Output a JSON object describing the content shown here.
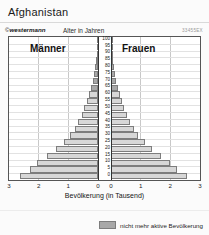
{
  "header": {
    "title": "Afghanistan",
    "brand": "westermann",
    "brand_mark": "©",
    "axis_title": "Alter in Jahren",
    "code": "33455EX"
  },
  "chart_data": {
    "type": "bar",
    "subtype": "population-pyramid",
    "title": "Afghanistan",
    "xlabel": "Bevölkerung (in Tausend)",
    "ylabel": "Alter in Jahren",
    "grid": true,
    "legend_position": "bottom-right",
    "panel_labels": {
      "left": "Männer",
      "right": "Frauen"
    },
    "xlim": [
      -3,
      3
    ],
    "xticks_left": [
      "3",
      "2",
      "1",
      "0"
    ],
    "xticks_right": [
      "0",
      "1",
      "2",
      "3"
    ],
    "unit": "Tausend",
    "age_groups": [
      "0",
      "5",
      "10",
      "15",
      "20",
      "25",
      "30",
      "35",
      "40",
      "45",
      "50",
      "55",
      "60",
      "65",
      "70",
      "75",
      "80",
      "85",
      "90",
      "95",
      "100"
    ],
    "series": [
      {
        "name": "Männer",
        "side": "left",
        "values": [
          2.62,
          2.3,
          2.05,
          1.72,
          1.42,
          1.16,
          0.94,
          0.78,
          0.66,
          0.55,
          0.46,
          0.38,
          0.31,
          0.24,
          0.18,
          0.13,
          0.09,
          0.06,
          0.035,
          0.018,
          0.007
        ]
      },
      {
        "name": "Frauen",
        "side": "right",
        "values": [
          2.55,
          2.24,
          2.0,
          1.68,
          1.39,
          1.13,
          0.92,
          0.76,
          0.64,
          0.54,
          0.45,
          0.37,
          0.3,
          0.235,
          0.175,
          0.125,
          0.085,
          0.055,
          0.032,
          0.016,
          0.006
        ]
      }
    ],
    "inactive_from_age": 65,
    "legend": [
      {
        "label": "nicht mehr aktive Bevölkerung",
        "color": "#a8a8a8"
      }
    ],
    "colors": {
      "active": "#d7d7d7",
      "inactive": "#a8a8a8",
      "outline": "#7d7d7d"
    }
  },
  "xaxis": {
    "label": "Bevölkerung (in Tausend)",
    "ticks": [
      "3",
      "2",
      "1",
      "0",
      "0",
      "1",
      "2",
      "3"
    ]
  },
  "legend": {
    "label": "nicht mehr aktive Bevölkerung"
  }
}
